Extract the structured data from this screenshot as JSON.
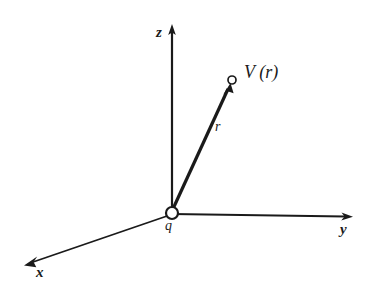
{
  "figure": {
    "background_color": "#ffffff",
    "ink_color": "#1a1a1a",
    "axes": [
      {
        "name": "z",
        "label": "z",
        "direction": "up",
        "origin": [
          172,
          213
        ],
        "tip": [
          172,
          25
        ]
      },
      {
        "name": "y",
        "label": "y",
        "direction": "right",
        "origin": [
          172,
          213
        ],
        "tip": [
          352,
          216
        ]
      },
      {
        "name": "x",
        "label": "x",
        "direction": "down-left",
        "origin": [
          172,
          213
        ],
        "tip": [
          25,
          264
        ]
      }
    ],
    "origin": {
      "marker": "open-circle",
      "label": "q",
      "center": [
        172,
        213
      ],
      "radius": 6
    },
    "vector": {
      "name": "r",
      "label": "r",
      "from": [
        172,
        212
      ],
      "to": [
        230,
        85
      ],
      "arrowhead": true,
      "stroke_width": 3
    },
    "field_point": {
      "marker": "open-circle",
      "label": "V (r)",
      "label_function": "V",
      "label_argument": "r",
      "center": [
        232,
        80
      ],
      "radius": 4
    }
  }
}
